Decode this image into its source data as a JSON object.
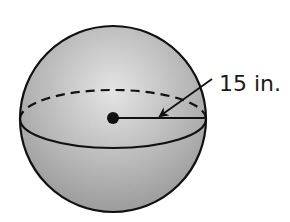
{
  "figure": {
    "shape": "sphere",
    "radius_label": "15 in.",
    "colors": {
      "background": "#ffffff",
      "sphere_light": "#e2e2e2",
      "sphere_mid": "#b9b9b9",
      "sphere_dark": "#9a9a9a",
      "stroke": "#111111"
    },
    "elements": {
      "sphere_outline": "sphere",
      "equator_back": "dashed hidden arc",
      "equator_front": "solid visible arc",
      "center_point": "center dot",
      "radius_segment": "radius line",
      "pointer_arrow": "arrow pointing to radius"
    }
  }
}
